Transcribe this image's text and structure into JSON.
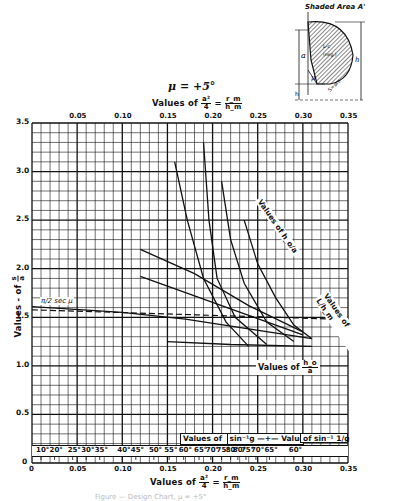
{
  "chart_data": {
    "type": "line",
    "title": "μ = +5°",
    "subtitle": "Values of a²/4 = r_m/h_m",
    "xlabel": "Values of a²/4 = r_m/h_m",
    "ylabel": "Values - of s/a",
    "xlim": [
      0,
      0.35
    ],
    "ylim": [
      0,
      3.5
    ],
    "grid": true,
    "x_ticks_bottom": [
      "0",
      "0.05",
      "0.10",
      "0.15",
      "0.20",
      "0.25",
      "0.30",
      "0.35"
    ],
    "x_ticks_top": [
      "0.05",
      "0.10",
      "0.15",
      "0.20",
      "0.25",
      "0.30",
      "0.35"
    ],
    "y_ticks": [
      "0",
      "0.5",
      "1.0",
      "1.5",
      "2.0",
      "2.5",
      "3.0",
      "3.5"
    ],
    "reference_line": {
      "label": "π/2 sec μ",
      "y": 1.577,
      "style": "dashed"
    },
    "angle_scale": {
      "label_left": "Values of sin⁻¹ g",
      "label_right": "Values of sin⁻¹ 1/g",
      "left_degrees": [
        "10°",
        "20°",
        "25°",
        "30°",
        "35°",
        "40°",
        "45°",
        "50°",
        "55°",
        "60°",
        "65°",
        "70°",
        "75°",
        "80°"
      ],
      "right_degrees": [
        "80°",
        "75°",
        "70°",
        "65°",
        "60°"
      ]
    },
    "curve_families": [
      {
        "name": "Values of h_o/a",
        "labels": [
          "0",
          "0.1",
          "0.2",
          "0.3",
          "0.4",
          "0.5",
          "0.6",
          "0.7",
          "0.8",
          "0.9",
          "1.0",
          "1.2",
          "1.4",
          "1.6",
          "1.8",
          "2.0"
        ]
      },
      {
        "name": "Values of L/h_m",
        "labels": [
          "-0.15",
          "-0.10",
          "-0.05",
          "0",
          "+0.05",
          "+0.1"
        ]
      }
    ],
    "series": [
      {
        "name": "h_o/a = 2.0",
        "x": [
          0.158,
          0.172,
          0.19,
          0.215,
          0.24
        ],
        "y": [
          3.1,
          2.5,
          1.9,
          1.45,
          1.2
        ]
      },
      {
        "name": "h_o/a = 1.0",
        "x": [
          0.19,
          0.196,
          0.205,
          0.225,
          0.26
        ],
        "y": [
          3.3,
          2.5,
          1.9,
          1.5,
          1.22
        ]
      },
      {
        "name": "h_o/a = 0.5",
        "x": [
          0.21,
          0.22,
          0.235,
          0.26,
          0.29
        ],
        "y": [
          2.9,
          2.3,
          1.85,
          1.45,
          1.25
        ]
      },
      {
        "name": "h_o/a = 0",
        "x": [
          0.235,
          0.25,
          0.27,
          0.29,
          0.31
        ],
        "y": [
          2.5,
          2.05,
          1.7,
          1.42,
          1.28
        ]
      },
      {
        "name": "L/h_m = -0.10",
        "x": [
          0.12,
          0.18,
          0.24,
          0.3
        ],
        "y": [
          2.2,
          1.95,
          1.62,
          1.35
        ]
      },
      {
        "name": "L/h_m = -0.05",
        "x": [
          0.12,
          0.18,
          0.24,
          0.3
        ],
        "y": [
          1.92,
          1.72,
          1.52,
          1.32
        ]
      },
      {
        "name": "L/h_m = 0",
        "x": [
          0.0,
          0.1,
          0.17,
          0.24,
          0.31
        ],
        "y": [
          1.61,
          1.55,
          1.48,
          1.38,
          1.28
        ]
      },
      {
        "name": "L/h_m = +0.1",
        "x": [
          0.15,
          0.22,
          0.31
        ],
        "y": [
          1.25,
          1.22,
          1.2
        ]
      }
    ],
    "inset": {
      "title": "Shaded Area A'",
      "labels": [
        "a",
        "h_o",
        "μ",
        "h_m",
        "S=arc",
        "L (neg.)",
        "c"
      ]
    }
  },
  "labels": {
    "title": "μ = +5°",
    "top_axis_prefix": "Values of",
    "bottom_axis_prefix": "Values of",
    "frac_a": "a²",
    "frac_4": "4",
    "frac_rm": "r_m",
    "frac_hm": "h_m",
    "y_axis": "Values - of",
    "y_frac_num": "s",
    "y_frac_den": "a",
    "ref_line": "π/2 sec μ",
    "values_of_ho": "Values of",
    "ho_num": "h_o",
    "ho_den": "a",
    "values_of_ho_top": "Values of h_o/a",
    "values_of_L": "Values of L/h_m",
    "inset_title": "Shaded Area A'",
    "angle_left": "Values of",
    "angle_left_fn": "sin⁻¹g",
    "angle_right": "Values",
    "angle_right_fn": "of  sin⁻¹ 1/g",
    "caption": "Figure — Design Chart, μ = +5°"
  }
}
